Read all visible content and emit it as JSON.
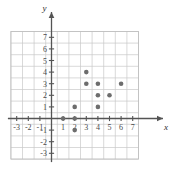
{
  "chart_data": {
    "type": "scatter",
    "title": "",
    "xlabel": "x",
    "ylabel": "y",
    "grid": true,
    "legend": "none",
    "xlim": [
      -3.5,
      7.5
    ],
    "ylim": [
      -3.5,
      7.5
    ],
    "x_ticks": [
      -3,
      -2,
      -1,
      1,
      2,
      3,
      4,
      5,
      6,
      7
    ],
    "y_ticks": [
      -3,
      -2,
      -1,
      1,
      2,
      3,
      4,
      5,
      6,
      7
    ],
    "x_tick_labels": [
      "-3",
      "-2",
      "-1",
      "1",
      "2",
      "3",
      "4",
      "5",
      "6",
      "7"
    ],
    "y_tick_labels": [
      "-3",
      "-2",
      "-1",
      "1",
      "2",
      "3",
      "4",
      "5",
      "6",
      "7"
    ],
    "points": [
      {
        "x": 1,
        "y": 0
      },
      {
        "x": 2,
        "y": 0
      },
      {
        "x": 2,
        "y": 1
      },
      {
        "x": 2,
        "y": -1
      },
      {
        "x": 3,
        "y": 3
      },
      {
        "x": 3,
        "y": 4
      },
      {
        "x": 4,
        "y": 1
      },
      {
        "x": 4,
        "y": 2
      },
      {
        "x": 4,
        "y": 3
      },
      {
        "x": 5,
        "y": 2
      },
      {
        "x": 6,
        "y": 3
      }
    ],
    "point_color": "#6d6d6d",
    "grid_color": "#c9c9c9",
    "axis_color": "#545454"
  },
  "axis_labels": {
    "x": "x",
    "y": "y"
  }
}
